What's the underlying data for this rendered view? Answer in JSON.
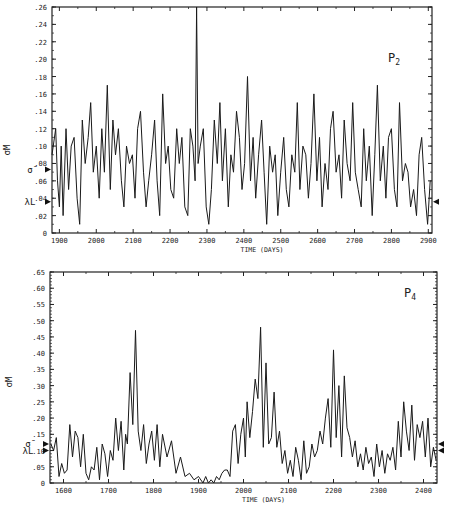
{
  "chart_data": [
    {
      "type": "line",
      "title": "",
      "panel_label": "P2",
      "xlabel": "TIME (DAYS)",
      "ylabel": "σM",
      "ylim": [
        0,
        0.26
      ],
      "xlim": [
        1880,
        2910
      ],
      "xticks": [
        1900,
        2000,
        2100,
        2200,
        2300,
        2400,
        2500,
        2600,
        2700,
        2800,
        2900
      ],
      "xtick_labels": [
        "1900",
        "2000",
        "2100",
        "2200",
        "2300",
        "2400",
        "2500",
        "2600",
        "2700",
        "2800",
        "2900"
      ],
      "yticks": [
        0,
        0.02,
        0.04,
        0.06,
        0.08,
        0.1,
        0.12,
        0.14,
        0.16,
        0.18,
        0.2,
        0.22,
        0.24,
        0.26
      ],
      "ytick_labels": [
        "0",
        ".02",
        ".04",
        ".06",
        ".08",
        ".10",
        ".12",
        ".14",
        ".16",
        ".18",
        ".20",
        ".22",
        ".24",
        ".26"
      ],
      "annotations": [
        {
          "text": "σ̄",
          "y": 0.073,
          "marker": "left-arrow"
        },
        {
          "text": "λL",
          "y": 0.036,
          "marker": "left-arrow"
        },
        {
          "text": "",
          "y": 0.036,
          "marker": "right-arrow"
        }
      ],
      "grid": false,
      "series": [
        {
          "name": "σM",
          "x": [
            1880,
            1890,
            1895,
            1900,
            1905,
            1910,
            1918,
            1925,
            1932,
            1940,
            1948,
            1955,
            1962,
            1970,
            1978,
            1985,
            1992,
            2000,
            2008,
            2015,
            2022,
            2030,
            2038,
            2045,
            2052,
            2060,
            2068,
            2075,
            2082,
            2090,
            2098,
            2105,
            2112,
            2120,
            2128,
            2135,
            2142,
            2150,
            2158,
            2165,
            2172,
            2180,
            2188,
            2195,
            2202,
            2210,
            2218,
            2225,
            2232,
            2240,
            2248,
            2255,
            2262,
            2268,
            2272,
            2276,
            2282,
            2290,
            2298,
            2305,
            2312,
            2320,
            2328,
            2335,
            2342,
            2350,
            2358,
            2365,
            2372,
            2380,
            2388,
            2395,
            2402,
            2410,
            2418,
            2425,
            2432,
            2440,
            2448,
            2455,
            2462,
            2470,
            2478,
            2485,
            2492,
            2500,
            2508,
            2515,
            2522,
            2530,
            2538,
            2545,
            2552,
            2560,
            2568,
            2575,
            2582,
            2590,
            2598,
            2605,
            2612,
            2620,
            2628,
            2635,
            2642,
            2650,
            2658,
            2665,
            2672,
            2680,
            2688,
            2695,
            2702,
            2710,
            2718,
            2725,
            2732,
            2740,
            2748,
            2755,
            2762,
            2770,
            2778,
            2785,
            2792,
            2800,
            2808,
            2815,
            2822,
            2830,
            2838,
            2845,
            2852,
            2860,
            2868,
            2875,
            2882,
            2890,
            2898,
            2905
          ],
          "values": [
            0.09,
            0.12,
            0.06,
            0.03,
            0.1,
            0.02,
            0.12,
            0.05,
            0.1,
            0.11,
            0.04,
            0.01,
            0.13,
            0.08,
            0.11,
            0.15,
            0.07,
            0.1,
            0.04,
            0.12,
            0.07,
            0.17,
            0.05,
            0.13,
            0.09,
            0.12,
            0.06,
            0.03,
            0.1,
            0.08,
            0.09,
            0.04,
            0.12,
            0.14,
            0.07,
            0.03,
            0.06,
            0.09,
            0.13,
            0.06,
            0.02,
            0.16,
            0.08,
            0.1,
            0.05,
            0.04,
            0.12,
            0.08,
            0.11,
            0.03,
            0.02,
            0.12,
            0.1,
            0.06,
            0.26,
            0.08,
            0.1,
            0.12,
            0.03,
            0.01,
            0.05,
            0.13,
            0.08,
            0.15,
            0.06,
            0.12,
            0.03,
            0.09,
            0.07,
            0.14,
            0.11,
            0.05,
            0.08,
            0.18,
            0.06,
            0.11,
            0.04,
            0.09,
            0.13,
            0.07,
            0.01,
            0.1,
            0.07,
            0.09,
            0.02,
            0.07,
            0.11,
            0.05,
            0.03,
            0.09,
            0.07,
            0.15,
            0.05,
            0.1,
            0.09,
            0.04,
            0.08,
            0.16,
            0.06,
            0.11,
            0.03,
            0.08,
            0.05,
            0.12,
            0.14,
            0.07,
            0.09,
            0.04,
            0.13,
            0.08,
            0.06,
            0.15,
            0.07,
            0.05,
            0.03,
            0.12,
            0.06,
            0.1,
            0.02,
            0.09,
            0.17,
            0.06,
            0.1,
            0.04,
            0.11,
            0.12,
            0.05,
            0.03,
            0.15,
            0.06,
            0.08,
            0.07,
            0.03,
            0.05,
            0.02,
            0.09,
            0.11,
            0.05,
            0.01,
            0.06
          ]
        }
      ]
    },
    {
      "type": "line",
      "title": "",
      "panel_label": "P4",
      "xlabel": "TIME (DAYS)",
      "ylabel": "σM",
      "ylim": [
        0,
        0.65
      ],
      "xlim": [
        1570,
        2430
      ],
      "xticks": [
        1600,
        1700,
        1800,
        1900,
        2000,
        2100,
        2200,
        2300,
        2400
      ],
      "xtick_labels": [
        "1600",
        "1700",
        "1800",
        "1900",
        "2000",
        "2100",
        "2200",
        "2300",
        "2400"
      ],
      "yticks": [
        0,
        0.05,
        0.1,
        0.15,
        0.2,
        0.25,
        0.3,
        0.35,
        0.4,
        0.45,
        0.5,
        0.55,
        0.6,
        0.65
      ],
      "ytick_labels": [
        "0",
        ".05",
        ".10",
        ".15",
        ".20",
        ".25",
        ".30",
        ".35",
        ".40",
        ".45",
        ".50",
        ".55",
        ".60",
        ".65"
      ],
      "annotations": [
        {
          "text": "σ̄",
          "y": 0.12,
          "marker": "left-arrow"
        },
        {
          "text": "λL",
          "y": 0.1,
          "marker": "left-arrow"
        },
        {
          "text": "",
          "y": 0.12,
          "marker": "right-arrow"
        },
        {
          "text": "",
          "y": 0.1,
          "marker": "right-arrow"
        }
      ],
      "grid": false,
      "series": [
        {
          "name": "σM",
          "x": [
            1572,
            1578,
            1584,
            1590,
            1596,
            1602,
            1608,
            1614,
            1620,
            1626,
            1632,
            1638,
            1644,
            1650,
            1656,
            1662,
            1668,
            1674,
            1680,
            1686,
            1692,
            1698,
            1704,
            1710,
            1716,
            1722,
            1728,
            1734,
            1738,
            1742,
            1748,
            1754,
            1760,
            1766,
            1772,
            1778,
            1784,
            1790,
            1796,
            1802,
            1808,
            1814,
            1820,
            1830,
            1840,
            1850,
            1860,
            1870,
            1880,
            1890,
            1900,
            1910,
            1916,
            1922,
            1928,
            1934,
            1940,
            1946,
            1952,
            1958,
            1964,
            1970,
            1976,
            1982,
            1988,
            1994,
            2000,
            2004,
            2008,
            2014,
            2020,
            2026,
            2032,
            2038,
            2044,
            2050,
            2056,
            2062,
            2068,
            2074,
            2080,
            2086,
            2092,
            2098,
            2104,
            2110,
            2116,
            2122,
            2128,
            2134,
            2140,
            2146,
            2152,
            2158,
            2164,
            2170,
            2176,
            2182,
            2188,
            2194,
            2200,
            2206,
            2212,
            2218,
            2224,
            2230,
            2236,
            2242,
            2248,
            2254,
            2260,
            2266,
            2272,
            2278,
            2284,
            2290,
            2296,
            2302,
            2308,
            2314,
            2320,
            2326,
            2332,
            2338,
            2344,
            2350,
            2356,
            2362,
            2368,
            2374,
            2380,
            2386,
            2392,
            2398,
            2404,
            2410,
            2416,
            2422,
            2428
          ],
          "values": [
            0.12,
            0.1,
            0.14,
            0.02,
            0.06,
            0.03,
            0.04,
            0.18,
            0.08,
            0.16,
            0.14,
            0.05,
            0.15,
            0.03,
            0.01,
            0.05,
            0.04,
            0.11,
            0.01,
            0.12,
            0.09,
            0.02,
            0.1,
            0.07,
            0.2,
            0.1,
            0.19,
            0.04,
            0.15,
            0.12,
            0.34,
            0.18,
            0.47,
            0.16,
            0.1,
            0.18,
            0.06,
            0.12,
            0.16,
            0.07,
            0.18,
            0.05,
            0.15,
            0.08,
            0.13,
            0.03,
            0.08,
            0.02,
            0.03,
            0.01,
            0.02,
            0.0,
            0.02,
            -0.01,
            0.01,
            0.0,
            0.02,
            0.01,
            0.03,
            0.04,
            0.04,
            0.02,
            0.16,
            0.18,
            0.06,
            0.15,
            0.2,
            0.08,
            0.25,
            0.14,
            0.22,
            0.32,
            0.26,
            0.48,
            0.11,
            0.37,
            0.12,
            0.14,
            0.28,
            0.11,
            0.16,
            0.06,
            0.1,
            0.03,
            0.07,
            0.02,
            0.11,
            0.07,
            0.01,
            0.13,
            0.03,
            0.05,
            0.12,
            0.08,
            0.1,
            0.16,
            0.12,
            0.2,
            0.26,
            0.11,
            0.41,
            0.14,
            0.3,
            0.08,
            0.33,
            0.17,
            0.14,
            0.08,
            0.13,
            0.05,
            0.09,
            0.04,
            0.11,
            0.06,
            0.08,
            0.02,
            0.12,
            0.05,
            0.1,
            0.03,
            0.09,
            0.07,
            0.11,
            0.04,
            0.19,
            0.08,
            0.25,
            0.16,
            0.1,
            0.24,
            0.07,
            0.18,
            0.14,
            0.19,
            0.08,
            0.2,
            0.05,
            0.11,
            0.07,
            0.16,
            0.1,
            0.03,
            0.12
          ]
        }
      ]
    }
  ]
}
